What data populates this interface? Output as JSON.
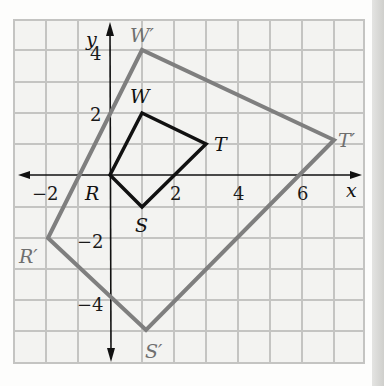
{
  "diagram": {
    "type": "coordinate-plane-dilation",
    "axes": {
      "x_label": "x",
      "y_label": "y"
    },
    "x_ticks": [
      {
        "value": -2,
        "label": "−2"
      },
      {
        "value": 2,
        "label": "2"
      },
      {
        "value": 4,
        "label": "4"
      },
      {
        "value": 6,
        "label": "6"
      }
    ],
    "y_ticks": [
      {
        "value": 4,
        "label": "4"
      },
      {
        "value": 2,
        "label": "2"
      },
      {
        "value": -2,
        "label": "−2"
      },
      {
        "value": -4,
        "label": "−4"
      }
    ],
    "preimage": {
      "name": "RWTS",
      "color": "#111111",
      "vertices": [
        {
          "label": "R",
          "x": 0,
          "y": 0
        },
        {
          "label": "W",
          "x": 1,
          "y": 2
        },
        {
          "label": "T",
          "x": 3,
          "y": 1
        },
        {
          "label": "S",
          "x": 1,
          "y": -1
        }
      ]
    },
    "image": {
      "name": "R'W'T'S'",
      "color": "#7f7f7f",
      "vertices": [
        {
          "label": "R′",
          "x": -2,
          "y": -2
        },
        {
          "label": "W′",
          "x": 1,
          "y": 4
        },
        {
          "label": "T′",
          "x": 7,
          "y": 1
        },
        {
          "label": "S′",
          "x": 1,
          "y": -5
        }
      ]
    },
    "colors": {
      "grid": "#c4c4c2",
      "axis": "#111111",
      "image_label": "#6f6f6f"
    }
  }
}
